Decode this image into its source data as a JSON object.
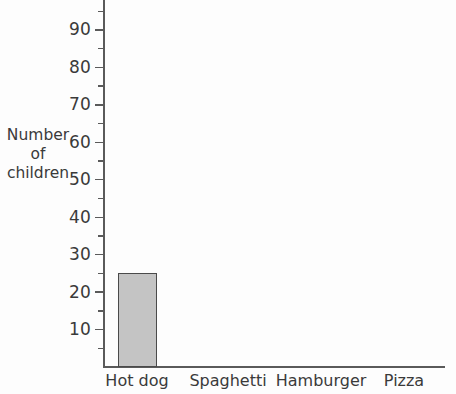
{
  "chart_data": {
    "type": "bar",
    "title": "",
    "xlabel": "",
    "ylabel": "Number of children",
    "ylabel_lines": [
      "Number",
      "of",
      "children"
    ],
    "categories": [
      "Hot dog",
      "Spaghetti",
      "Hamburger",
      "Pizza"
    ],
    "values": [
      25,
      null,
      null,
      null
    ],
    "ylim": [
      0,
      95
    ],
    "ytick_labels": [
      "90",
      "80",
      "70",
      "60",
      "50",
      "40",
      "30",
      "20",
      "10"
    ],
    "ytick_values": [
      90,
      80,
      70,
      60,
      50,
      40,
      30,
      20,
      10
    ],
    "minor_tick_values": [
      95,
      85,
      75,
      65,
      55,
      45,
      35,
      25,
      15,
      5
    ],
    "grid": false,
    "legend": false,
    "bar_fill_color": "#c4c4c4",
    "bar_edge_color": "#4a4a4a",
    "axis_color": "#5a5a5a",
    "text_color": "#3a3a3a",
    "background_color": "#fdfdfd"
  },
  "axis": {
    "y_title_line1": "Number",
    "y_title_line2": "of",
    "y_title_line3": "children"
  },
  "ticks": {
    "y": [
      {
        "label": "90",
        "value": 90
      },
      {
        "label": "80",
        "value": 80
      },
      {
        "label": "70",
        "value": 70
      },
      {
        "label": "60",
        "value": 60
      },
      {
        "label": "50",
        "value": 50
      },
      {
        "label": "40",
        "value": 40
      },
      {
        "label": "30",
        "value": 30
      },
      {
        "label": "20",
        "value": 20
      },
      {
        "label": "10",
        "value": 10
      }
    ]
  },
  "categories": [
    {
      "label": "Hot dog",
      "value": 25
    },
    {
      "label": "Spaghetti",
      "value": null
    },
    {
      "label": "Hamburger",
      "value": null
    },
    {
      "label": "Pizza",
      "value": null
    }
  ]
}
